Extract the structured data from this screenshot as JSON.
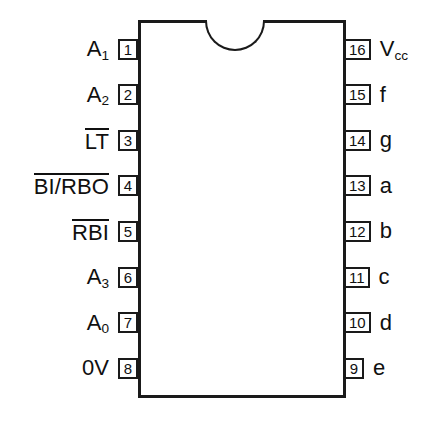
{
  "diagram": {
    "type": "ic-pinout",
    "package": "DIP-16",
    "title": "",
    "notch": "top-center-semicircle",
    "colors": {
      "outline": "#1a1a1a",
      "text": "#101010",
      "background": "#ffffff"
    },
    "pins": {
      "left": [
        {
          "number": "1",
          "label": "A",
          "sub": "1",
          "overline": false
        },
        {
          "number": "2",
          "label": "A",
          "sub": "2",
          "overline": false
        },
        {
          "number": "3",
          "label": "LT",
          "sub": "",
          "overline": true
        },
        {
          "number": "4",
          "label": "BI/RBO",
          "sub": "",
          "overline": true
        },
        {
          "number": "5",
          "label": "RBI",
          "sub": "",
          "overline": true
        },
        {
          "number": "6",
          "label": "A",
          "sub": "3",
          "overline": false
        },
        {
          "number": "7",
          "label": "A",
          "sub": "0",
          "overline": false
        },
        {
          "number": "8",
          "label": "0V",
          "sub": "",
          "overline": false
        }
      ],
      "right": [
        {
          "number": "16",
          "label": "V",
          "sub": "cc",
          "overline": false
        },
        {
          "number": "15",
          "label": "f",
          "sub": "",
          "overline": false
        },
        {
          "number": "14",
          "label": "g",
          "sub": "",
          "overline": false
        },
        {
          "number": "13",
          "label": "a",
          "sub": "",
          "overline": false
        },
        {
          "number": "12",
          "label": "b",
          "sub": "",
          "overline": false
        },
        {
          "number": "11",
          "label": "c",
          "sub": "",
          "overline": false
        },
        {
          "number": "10",
          "label": "d",
          "sub": "",
          "overline": false
        },
        {
          "number": "9",
          "label": "e",
          "sub": "",
          "overline": false
        }
      ]
    }
  }
}
